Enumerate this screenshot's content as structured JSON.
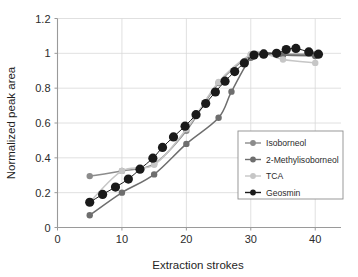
{
  "chart_data": {
    "type": "line",
    "title": "",
    "xlabel": "Extraction strokes",
    "ylabel": "Normalized peak area",
    "xlim": [
      0,
      44
    ],
    "ylim": [
      0,
      1.2
    ],
    "xticks": [
      0,
      10,
      20,
      30,
      40
    ],
    "xtick_labels": [
      "0",
      "10",
      "20",
      "30",
      "40"
    ],
    "yticks": [
      0,
      0.2,
      0.4,
      0.6,
      0.8,
      1,
      1.2
    ],
    "ytick_labels": [
      "0",
      "0.2",
      "0.4",
      "0.6",
      "0.8",
      "1",
      "1.2"
    ],
    "grid": true,
    "grid_axis": "y",
    "legend_position": "lower-right-inside",
    "markers": "filled-circle",
    "series": [
      {
        "name": "Isoborneol",
        "color": "#8c8c8c",
        "marker_size": 3.2,
        "x": [
          5,
          10,
          15,
          20,
          25,
          30,
          32,
          35,
          40
        ],
        "y": [
          0.295,
          0.325,
          0.365,
          0.555,
          0.83,
          0.99,
          1.005,
          0.995,
          0.995
        ]
      },
      {
        "name": "2-Methylisoborneol",
        "color": "#6e6e6e",
        "marker_size": 3.2,
        "x": [
          5,
          10,
          15,
          20,
          25,
          27,
          30,
          32,
          35,
          40
        ],
        "y": [
          0.07,
          0.2,
          0.305,
          0.48,
          0.63,
          0.78,
          0.975,
          1.005,
          0.99,
          0.985
        ]
      },
      {
        "name": "TCA",
        "color": "#c6c6c6",
        "marker_size": 3.2,
        "x": [
          5,
          10,
          15,
          20,
          25,
          30,
          32,
          35,
          40
        ],
        "y": [
          0.145,
          0.325,
          0.36,
          0.565,
          0.835,
          0.995,
          1.0,
          0.965,
          0.945
        ]
      },
      {
        "name": "Geosmin",
        "color": "#1a1a1a",
        "marker_size": 4.6,
        "x": [
          5,
          7,
          9,
          11,
          12.8,
          14.8,
          16.3,
          18,
          19.8,
          21.5,
          23,
          24.5,
          26,
          27.5,
          29,
          30.5,
          32,
          34,
          35.5,
          37,
          39,
          40.5
        ],
        "y": [
          0.145,
          0.19,
          0.232,
          0.278,
          0.335,
          0.398,
          0.46,
          0.52,
          0.582,
          0.648,
          0.712,
          0.778,
          0.84,
          0.895,
          0.945,
          0.99,
          0.995,
          1.0,
          1.022,
          1.028,
          1.008,
          0.995
        ]
      }
    ]
  },
  "legend": {
    "entries": [
      {
        "label": "Isoborneol"
      },
      {
        "label": "2-Methylisoborneol"
      },
      {
        "label": "TCA"
      },
      {
        "label": "Geosmin"
      }
    ]
  },
  "axes": {
    "x_title": "Extraction strokes",
    "y_title": "Normalized peak area"
  },
  "colors": {
    "isoborneol": "#8c8c8c",
    "methylisoborneol": "#6e6e6e",
    "tca": "#c6c6c6",
    "geosmin": "#1a1a1a",
    "grid": "#d8d8d8",
    "axis": "#9a9a9a",
    "background": "#ffffff"
  }
}
